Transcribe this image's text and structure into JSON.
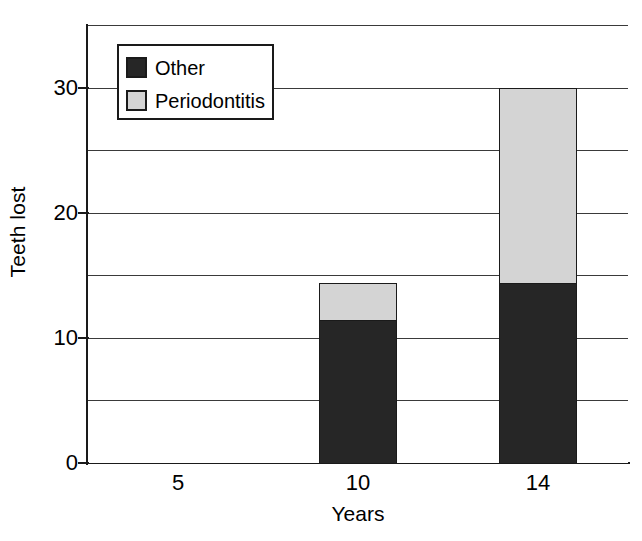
{
  "chart_data": {
    "type": "bar",
    "subtype": "stacked-bar",
    "title": "",
    "xlabel": "Years",
    "ylabel": "Teeth lost",
    "categories": [
      "5",
      "10",
      "14"
    ],
    "series": [
      {
        "name": "Other",
        "color": "#262626",
        "values": [
          0,
          11.4,
          14.4
        ]
      },
      {
        "name": "Periodontitis",
        "color": "#d4d4d4",
        "values": [
          0,
          3.0,
          15.6
        ]
      }
    ],
    "totals": [
      0,
      14.4,
      30.0
    ],
    "ylim": [
      0,
      35
    ],
    "yticks": [
      0,
      10,
      20,
      30
    ],
    "ytick_labels": [
      "0",
      "10",
      "20",
      "30"
    ],
    "gridlines_y": [
      0,
      5,
      10,
      15,
      20,
      25,
      30,
      35
    ],
    "grid": true,
    "legend_position": "upper-left-inside",
    "legend_entries": [
      "Other",
      "Periodontitis"
    ]
  },
  "axes": {
    "y_title": "Teeth lost",
    "x_title": "Years",
    "y_tick_labels": [
      "0",
      "10",
      "20",
      "30"
    ],
    "x_tick_labels": [
      "5",
      "10",
      "14"
    ]
  },
  "legend": {
    "rows": [
      {
        "label": "Other",
        "color": "#262626"
      },
      {
        "label": "Periodontitis",
        "color": "#d4d4d4"
      }
    ]
  }
}
